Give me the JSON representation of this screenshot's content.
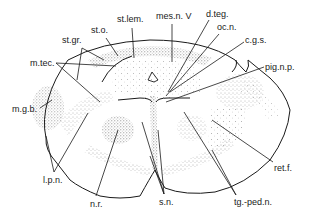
{
  "figure": {
    "type": "anatomical-line-drawing",
    "labels": {
      "st_o": "st.o.",
      "st_lem": "st.lem.",
      "mes_n_v": "mes.n. V",
      "d_teg": "d.teg.",
      "oc_n": "oc.n.",
      "c_g_s": "c.g.s.",
      "st_gr": "st.gr.",
      "m_tec": "m.tec.",
      "pig_n_p": "pig.n.p.",
      "m_g_b": "m.g.b.",
      "ret_f": "ret.f.",
      "l_p_n": "l.p.n.",
      "n_r": "n.r.",
      "s_n": "s.n.",
      "tg_ped_n": "tg.-ped.n."
    },
    "colors": {
      "ink": "#1a1a1a",
      "background": "#ffffff"
    }
  }
}
